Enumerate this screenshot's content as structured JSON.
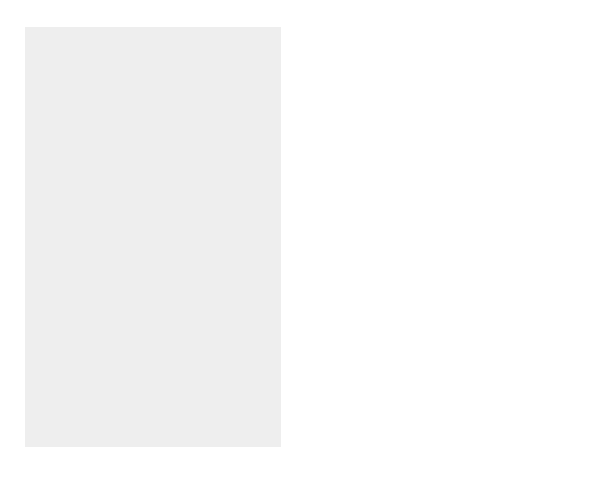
{
  "colors": {
    "background_panel": "#ececec",
    "three_times": "#5a5a5a",
    "two_times": "#8f8f8f",
    "us_rate": "#b9b9b9",
    "below_us": "#999999",
    "less_than_zero": "#3f3f3f",
    "text": "#222222"
  },
  "states": {
    "washington": {
      "name": "WASHINGTON",
      "value": "21.1"
    },
    "oregon": {
      "name": "OREGON",
      "value": "20.4"
    },
    "california": {
      "name": "CALIFORNIA",
      "value": "13.8"
    },
    "nevada": {
      "name": "NEVADA",
      "value": "66.3"
    },
    "idaho": {
      "name": "IDAHO",
      "value": "28.5"
    },
    "montana": {
      "name": "MONTANA",
      "value": "12.9"
    },
    "wyoming": {
      "name": "WYOMING",
      "value": "8.9"
    },
    "utah": {
      "name": "UTAH",
      "value": "29.6"
    },
    "arizona": {
      "name": "ARIZONA",
      "value": "40.0"
    },
    "colorado": {
      "name": "COLORADO",
      "value": "30.6"
    },
    "new_mexico": {
      "name1": "NEW",
      "name2": "MEXICO",
      "value": "20.1"
    },
    "north_dakota": {
      "name1": "NORTH",
      "name2": "DAKOTA",
      "value": "0.5"
    },
    "south_dakota": {
      "name1": "SOUTH",
      "name2": "DAKOTA",
      "value": "8.5"
    },
    "nebraska": {
      "name": "NEBRASKA",
      "value": "8.4"
    },
    "kansas": {
      "name": "KANSAS",
      "value": "8.5"
    },
    "oklahoma": {
      "name": "OKLAHOMA",
      "value": "9.7"
    },
    "texas": {
      "name": "TEXAS",
      "value": "22.8"
    },
    "minnesota": {
      "name": "MINNESOTA",
      "value": "12.4"
    },
    "iowa": {
      "name": "IOWA",
      "value": "5.4"
    },
    "missouri": {
      "name": "MISSOURI",
      "value": "9.3"
    },
    "arkansas": {
      "name": "ARKANSAS",
      "value": "13.7"
    },
    "louisiana": {
      "name": "LOUISIANA",
      "value": "5.9"
    },
    "wisconsin": {
      "name": "WISCONSIN",
      "value": "9.6"
    },
    "illinois": {
      "name": "ILLINOIS",
      "value": "8.6"
    },
    "michigan": {
      "name": "MICHIGAN",
      "value": "6.9"
    },
    "indiana": {
      "name": "INDIANA",
      "value": "9.7"
    },
    "ohio": {
      "name": "OHIO",
      "value": "4.7"
    },
    "kentucky": {
      "name": "KENTUCKY",
      "value": "9.7"
    },
    "tennessee": {
      "name": "TENNESSEE",
      "value": "16.7"
    },
    "mississippi": {
      "name": "MISSISSIPPI",
      "value": "10.5"
    },
    "alabama": {
      "name": "ALABAMA",
      "value": "10.1"
    },
    "georgia": {
      "name": "GEORGIA",
      "value": "26.4"
    },
    "florida": {
      "name": "FLORIDA",
      "value": "23.5"
    },
    "south_carolina": {
      "name1": "SOUTH",
      "name2": "CAROLINA",
      "value": "15.1"
    },
    "north_carolina": {
      "name": "NORTH CAROLINA",
      "value": "21.4"
    },
    "virginia": {
      "name": "VIRGINIA",
      "value": "14.4"
    },
    "west_virginia": {
      "name1": "WEST",
      "name2": "VIRGINIA",
      "value": "0.8"
    },
    "pennsylvania": {
      "name": "PENNSYLVANIA",
      "value": "3.4"
    },
    "new_york": {
      "name1": "NEW",
      "name2": "YORK",
      "value": "5.5"
    },
    "maine": {
      "name": "MAINE",
      "value": "3.8"
    },
    "rhode_island": {
      "name1": "RHODE",
      "name2": "ISLAND",
      "value": "4.5"
    },
    "alaska": {
      "name": "ALASKA",
      "value": "14.0"
    },
    "hawaii": {
      "name": "HAWAII",
      "value": "9.3"
    },
    "puerto_rico": {
      "name": "PUERTO RICO",
      "value": "8.1"
    }
  },
  "callouts": {
    "new_hampshire": "NEW HAMPSHIRE 11.4",
    "vermont": "VERMONT 8.2",
    "massachusetts": "MASSACHUSETTS 5.5",
    "connecticut": "CT 3.6",
    "new_jersey": "NJ 8.9",
    "delaware": "DE 17.6",
    "maryland": "MD 10.8",
    "dc_line1": "WASHINGTON,",
    "dc_line2": "DC -5.7"
  },
  "legend": {
    "title1": "PERCENT",
    "title2": "CHANGE",
    "ranges": [
      "39.6 or more",
      "26.4 to 39.5",
      "13.2 to 26.3",
      "0 to 13.1",
      "Less than 0"
    ],
    "markers": [
      "Three times U.S. rate",
      "Two times U.S. rate",
      "U.S. rate (13.2)",
      "No change"
    ]
  }
}
